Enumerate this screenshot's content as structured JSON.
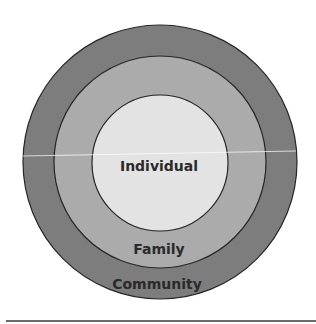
{
  "diagram": {
    "type": "concentric-circles",
    "rings": [
      {
        "label": "Community",
        "color": "#7d7d7d"
      },
      {
        "label": "Family",
        "color": "#ababab"
      },
      {
        "label": "Individual",
        "color": "#e3e3e3"
      }
    ],
    "stroke_color": "#262626"
  }
}
